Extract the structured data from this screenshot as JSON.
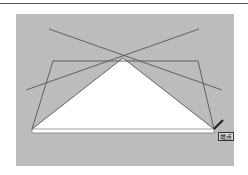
{
  "drawing": {
    "background": "#bcbcbc",
    "line_color": "#555555",
    "fill_color": "#ffffff",
    "apex": [
      123,
      58
    ],
    "base": [
      [
        32,
        129
      ],
      [
        214,
        129
      ]
    ],
    "trapezoid": [
      [
        53,
        61
      ],
      [
        198,
        61
      ],
      [
        214,
        129
      ],
      [
        32,
        129
      ]
    ],
    "cross_lines": [
      [
        [
          49,
          29
        ],
        [
          222,
          90
        ]
      ],
      [
        [
          199,
          29
        ],
        [
          26,
          90
        ]
      ]
    ]
  },
  "snap_tooltip": {
    "label": "端点"
  }
}
